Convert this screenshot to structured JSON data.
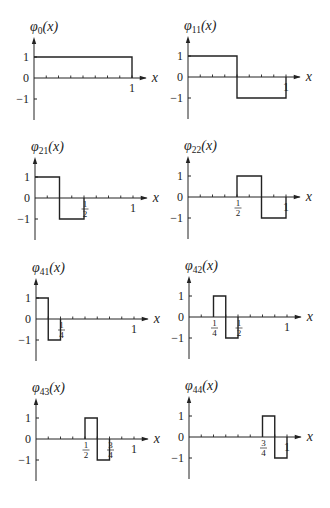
{
  "figure": {
    "panels": [
      {
        "id": "phi0",
        "title_base": "φ",
        "title_sub": "0",
        "title_arg": "(x)",
        "origin": [
          34,
          78
        ]
      },
      {
        "id": "phi11",
        "title_base": "φ",
        "title_sub": "11",
        "title_arg": "(x)",
        "origin": [
          188,
          77
        ]
      },
      {
        "id": "phi21",
        "title_base": "φ",
        "title_sub": "21",
        "title_arg": "(x)",
        "origin": [
          35,
          198
        ]
      },
      {
        "id": "phi22",
        "title_base": "φ",
        "title_sub": "22",
        "title_arg": "(x)",
        "origin": [
          188,
          197
        ]
      },
      {
        "id": "phi41",
        "title_base": "φ",
        "title_sub": "41",
        "title_arg": "(x)",
        "origin": [
          36,
          319
        ]
      },
      {
        "id": "phi42",
        "title_base": "φ",
        "title_sub": "42",
        "title_arg": "(x)",
        "origin": [
          189,
          317
        ]
      },
      {
        "id": "phi43",
        "title_base": "φ",
        "title_sub": "43",
        "title_arg": "(x)",
        "origin": [
          36,
          439
        ]
      },
      {
        "id": "phi44",
        "title_base": "φ",
        "title_sub": "44",
        "title_arg": "(x)",
        "origin": [
          189,
          437
        ]
      }
    ]
  },
  "chart_data": [
    {
      "type": "line",
      "title": "φ0(x)",
      "xlabel": "x",
      "ylabel": "",
      "xlim": [
        0,
        1.15
      ],
      "ylim": [
        -1.9,
        1.9
      ],
      "yticks": [
        "1",
        "0",
        "−1"
      ],
      "xtick_labels": [
        {
          "x": 1,
          "label": "1"
        }
      ],
      "x_minor_ticks_step": 0.125,
      "grid": false,
      "series": [
        {
          "name": "φ0",
          "x": [
            0,
            1,
            1
          ],
          "y": [
            1,
            1,
            0
          ]
        }
      ]
    },
    {
      "type": "line",
      "title": "φ11(x)",
      "xlabel": "x",
      "ylabel": "",
      "xlim": [
        0,
        1.15
      ],
      "ylim": [
        -1.9,
        1.9
      ],
      "yticks": [
        "1",
        "0",
        "−1"
      ],
      "xtick_labels": [
        {
          "x": 1,
          "label": "1"
        }
      ],
      "x_minor_ticks_step": 0.125,
      "grid": false,
      "series": [
        {
          "name": "φ11",
          "x": [
            0,
            0.5,
            0.5,
            1,
            1
          ],
          "y": [
            1,
            1,
            -1,
            -1,
            0
          ]
        }
      ]
    },
    {
      "type": "line",
      "title": "φ21(x)",
      "xlabel": "x",
      "ylabel": "",
      "xlim": [
        0,
        1.15
      ],
      "ylim": [
        -1.9,
        1.9
      ],
      "yticks": [
        "1",
        "0",
        "−1"
      ],
      "xtick_labels": [
        {
          "x": 0.5,
          "label": "1/2"
        },
        {
          "x": 1,
          "label": "1"
        }
      ],
      "x_minor_ticks_step": 0.125,
      "grid": false,
      "series": [
        {
          "name": "φ21",
          "x": [
            0,
            0.25,
            0.25,
            0.5,
            0.5
          ],
          "y": [
            1,
            1,
            -1,
            -1,
            0
          ]
        }
      ]
    },
    {
      "type": "line",
      "title": "φ22(x)",
      "xlabel": "x",
      "ylabel": "",
      "xlim": [
        0,
        1.15
      ],
      "ylim": [
        -1.9,
        1.9
      ],
      "yticks": [
        "1",
        "0",
        "−1"
      ],
      "xtick_labels": [
        {
          "x": 0.5,
          "label": "1/2"
        },
        {
          "x": 1,
          "label": "1"
        }
      ],
      "x_minor_ticks_step": 0.125,
      "grid": false,
      "series": [
        {
          "name": "φ22",
          "x": [
            0.5,
            0.5,
            0.75,
            0.75,
            1,
            1
          ],
          "y": [
            0,
            1,
            1,
            -1,
            -1,
            0
          ]
        }
      ]
    },
    {
      "type": "line",
      "title": "φ41(x)",
      "xlabel": "x",
      "ylabel": "",
      "xlim": [
        0,
        1.15
      ],
      "ylim": [
        -1.9,
        1.9
      ],
      "yticks": [
        "1",
        "0",
        "−1"
      ],
      "xtick_labels": [
        {
          "x": 0.25,
          "label": "1/4"
        },
        {
          "x": 1,
          "label": "1"
        }
      ],
      "x_minor_ticks_step": 0.125,
      "grid": false,
      "series": [
        {
          "name": "φ41",
          "x": [
            0,
            0.125,
            0.125,
            0.25,
            0.25
          ],
          "y": [
            1,
            1,
            -1,
            -1,
            0
          ]
        }
      ]
    },
    {
      "type": "line",
      "title": "φ42(x)",
      "xlabel": "x",
      "ylabel": "",
      "xlim": [
        0,
        1.15
      ],
      "ylim": [
        -1.9,
        1.9
      ],
      "yticks": [
        "1",
        "0",
        "−1"
      ],
      "xtick_labels": [
        {
          "x": 0.25,
          "label": "1/4"
        },
        {
          "x": 0.5,
          "label": "1/2"
        },
        {
          "x": 1,
          "label": "1"
        }
      ],
      "x_minor_ticks_step": 0.125,
      "grid": false,
      "series": [
        {
          "name": "φ42",
          "x": [
            0.25,
            0.25,
            0.375,
            0.375,
            0.5,
            0.5
          ],
          "y": [
            0,
            1,
            1,
            -1,
            -1,
            0
          ]
        }
      ]
    },
    {
      "type": "line",
      "title": "φ43(x)",
      "xlabel": "x",
      "ylabel": "",
      "xlim": [
        0,
        1.15
      ],
      "ylim": [
        -1.9,
        1.9
      ],
      "yticks": [
        "1",
        "0",
        "−1"
      ],
      "xtick_labels": [
        {
          "x": 0.5,
          "label": "1/2"
        },
        {
          "x": 0.75,
          "label": "3/4"
        },
        {
          "x": 1,
          "label": "1"
        }
      ],
      "x_minor_ticks_step": 0.125,
      "grid": false,
      "series": [
        {
          "name": "φ43",
          "x": [
            0.5,
            0.5,
            0.625,
            0.625,
            0.75,
            0.75
          ],
          "y": [
            0,
            1,
            1,
            -1,
            -1,
            0
          ]
        }
      ]
    },
    {
      "type": "line",
      "title": "φ44(x)",
      "xlabel": "x",
      "ylabel": "",
      "xlim": [
        0,
        1.15
      ],
      "ylim": [
        -1.9,
        1.9
      ],
      "yticks": [
        "1",
        "0",
        "−1"
      ],
      "xtick_labels": [
        {
          "x": 0.75,
          "label": "3/4"
        },
        {
          "x": 1,
          "label": "1"
        }
      ],
      "x_minor_ticks_step": 0.125,
      "grid": false,
      "series": [
        {
          "name": "φ44",
          "x": [
            0.75,
            0.75,
            0.875,
            0.875,
            1,
            1
          ],
          "y": [
            0,
            1,
            1,
            -1,
            -1,
            0
          ]
        }
      ]
    }
  ]
}
